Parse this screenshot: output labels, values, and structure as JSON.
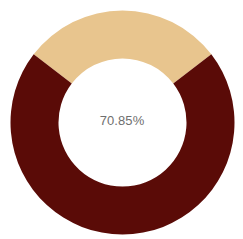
{
  "chart_data": {
    "type": "pie",
    "variant": "donut",
    "title": "",
    "center_label": "70.85%",
    "slices": [
      {
        "label": "Filled",
        "value": 70.85,
        "color": "#5A0B07"
      },
      {
        "label": "Remaining",
        "value": 29.15,
        "color": "#E8C58E"
      }
    ],
    "legend": "none",
    "start_angle_note": "remaining segment centered at top"
  },
  "colors": {
    "primary": "#5A0B07",
    "secondary": "#E8C58E",
    "center_text": "#6F6F6F",
    "background": "#FFFFFF"
  }
}
